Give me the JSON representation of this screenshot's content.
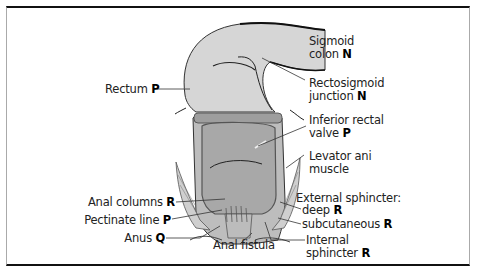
{
  "figure": {
    "labels": {
      "rectum": {
        "text": "Rectum",
        "code": "P"
      },
      "sigmoid_colon": {
        "line1": "Sigmoid",
        "line2": "colon",
        "code": "N"
      },
      "rectosigmoid_junction": {
        "line1": "Rectosigmoid",
        "line2": "junction",
        "code": "N"
      },
      "inferior_rectal_valve": {
        "line1": "Inferior rectal",
        "line2": "valve",
        "code": "P"
      },
      "levator_ani": {
        "line1": "Levator ani",
        "line2": "muscle"
      },
      "anal_columns": {
        "text": "Anal columns",
        "code": "R"
      },
      "pectinate_line": {
        "text": "Pectinate line",
        "code": "P"
      },
      "anus": {
        "text": "Anus",
        "code": "Q"
      },
      "anal_fistula": {
        "text": "Anal fistula"
      },
      "external_sphincter": {
        "text": "External sphincter:"
      },
      "ext_deep": {
        "text": "deep",
        "code": "R"
      },
      "ext_subcutaneous": {
        "text": "subcutaneous",
        "code": "R"
      },
      "internal_sphincter": {
        "line1": "Internal",
        "line2": "sphincter",
        "code": "R"
      }
    },
    "colors": {
      "tissue_light": "#d9d9d9",
      "tissue_mid": "#b8b8b8",
      "lumen": "#a9a9a9",
      "line": "#333333"
    }
  }
}
